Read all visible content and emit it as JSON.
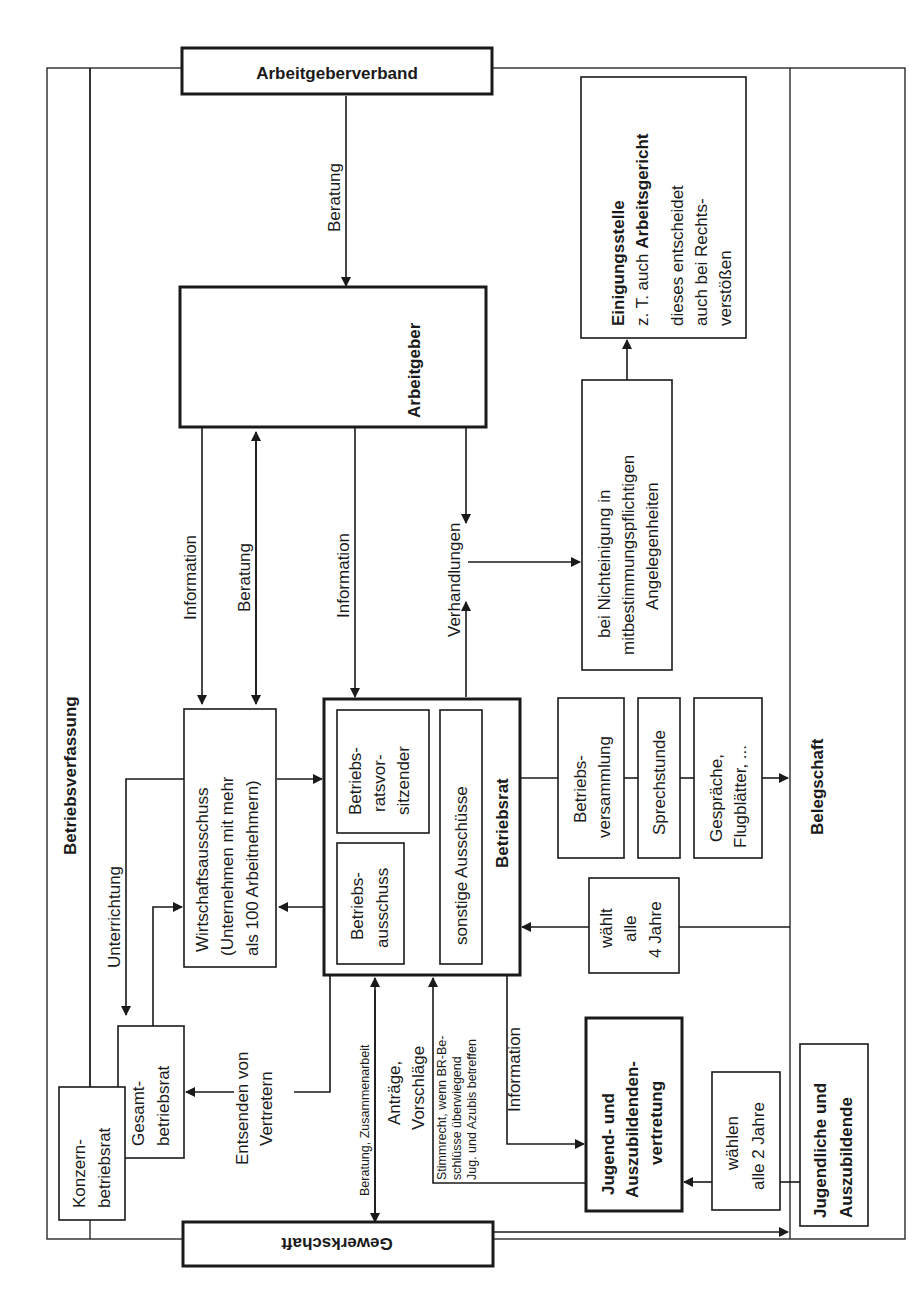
{
  "diagram": {
    "frame_label": "Betriebsverfassung",
    "nodes": {
      "arbeitgeberverband": "Arbeitgeberverband",
      "arbeitgeber": "Arbeitgeber",
      "gewerkschaft": "Gewerkschaft",
      "einigungsstelle": {
        "title": "Einigungsstelle",
        "lines": [
          "z. T. auch Arbeitsgericht",
          "dieses entscheidet",
          "auch bei Rechts-",
          "verstößen"
        ],
        "emphasis": "Arbeitsgericht"
      },
      "nichteinigung": [
        "bei Nichteinigung in",
        "mitbestimmungspflichtigen",
        "Angelegenheiten"
      ],
      "wirtschaftsausschuss": [
        "Wirtschaftsausschuss",
        "(Unternehmen mit mehr",
        "als 100 Arbeitnehmern)"
      ],
      "betriebsrat": {
        "title": "Betriebsrat",
        "vorsitzender": [
          "Betriebs-",
          "ratsvor-",
          "sitzender"
        ],
        "ausschuss": [
          "Betriebs-",
          "ausschuss"
        ],
        "sonstige": "sonstige Ausschüsse"
      },
      "betriebsversammlung": [
        "Betriebs-",
        "versammlung"
      ],
      "sprechstunde": "Sprechstunde",
      "gespraeche": [
        "Gespräche,",
        "Flugblätter, ..."
      ],
      "belegschaft": "Belegschaft",
      "waehlt": [
        "wählt",
        "alle",
        "4 Jahre"
      ],
      "gesamtbetriebsrat": [
        "Gesamt-",
        "betriebsrat"
      ],
      "konzernbetriebsrat": [
        "Konzern-",
        "betriebsrat"
      ],
      "jav": [
        "Jugend- und",
        "Auszubildenden-",
        "vertretung"
      ],
      "waehlen": [
        "wählen",
        "alle 2 Jahre"
      ],
      "jugendliche": [
        "Jugendliche und",
        "Auszubildende"
      ]
    },
    "edge_labels": {
      "beratung_verband": "Beratung",
      "information_wa": "Information",
      "beratung_wa": "Beratung",
      "information_br": "Information",
      "verhandlungen": "Verhandlungen",
      "unterrichtung": "Unterrichtung",
      "entsenden": [
        "Entsenden von",
        "Vertretern"
      ],
      "beratung_gew": "Beratung, Zusammenarbeit",
      "antraege": [
        "Anträge,",
        "Vorschläge"
      ],
      "stimmrecht": [
        "Stimmrecht, wenn BR-Be-",
        "schlüsse überwiegend",
        "Jug. und Azubis betreffen"
      ],
      "information_jav": "Information"
    }
  }
}
